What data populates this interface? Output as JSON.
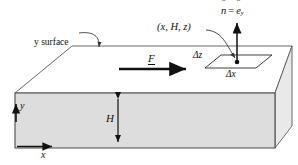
{
  "figure": {
    "background": "#ffffff",
    "colors": {
      "front_face": "#dcdcdc",
      "right_face": "#e8e8e8",
      "top_face": "#ffffff",
      "outline": "#555555",
      "heavy_line": "#111111",
      "text": "#111111"
    },
    "labels": {
      "y_surface": "y surface",
      "point": "(x, H, z)",
      "normal_n": "n",
      "normal_equals": "=",
      "normal_e": "e",
      "normal_e_sub": "y",
      "force": "F",
      "delta_z": "Δz",
      "delta_x": "Δx",
      "height": "H",
      "axis_x": "x",
      "axis_y": "y"
    },
    "geometry": {
      "front_face_points": "15,93 275,93 275,148 15,148",
      "top_face_points": "15,93 72,46 292,46 275,93",
      "right_face_points": "275,93 292,46 292,126 275,148",
      "patch_points": "205,68 221,55 272,55 256,68",
      "height_arrow": {
        "x": 118,
        "y_top": 93,
        "y_bottom": 148
      },
      "force_arrow": {
        "x1": 119,
        "x2": 187,
        "y": 68
      },
      "x_axis_arrow": {
        "x1": 18,
        "x2": 52,
        "y": 146
      },
      "y_axis_marker": {
        "x": 16,
        "y": 107
      },
      "normal_arrow": {
        "x": 237,
        "y_tail": 62,
        "y_head": 22
      },
      "patch_point_dot": {
        "x": 237,
        "y": 62
      }
    }
  }
}
